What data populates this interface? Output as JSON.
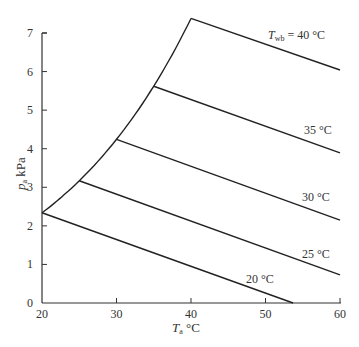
{
  "chart_data": {
    "type": "line",
    "title": "",
    "xlabel": "T_a °C",
    "ylabel": "p_a kPa",
    "xlim": [
      20,
      60
    ],
    "ylim": [
      0,
      7
    ],
    "x_ticks": [
      20,
      30,
      40,
      50,
      60
    ],
    "y_ticks": [
      0,
      1,
      2,
      3,
      4,
      5,
      6,
      7
    ],
    "grid": false,
    "legend": null,
    "saturation_curve": {
      "name": "saturation",
      "x": [
        20,
        25,
        30,
        35,
        40
      ],
      "y": [
        2.34,
        3.17,
        4.24,
        5.62,
        7.38
      ]
    },
    "series": [
      {
        "name": "T_wb = 20 °C",
        "label": "20 °C",
        "x": [
          20,
          53.7
        ],
        "y": [
          2.34,
          0.0
        ]
      },
      {
        "name": "T_wb = 25 °C",
        "label": "25 °C",
        "x": [
          25,
          60
        ],
        "y": [
          3.17,
          0.73
        ]
      },
      {
        "name": "T_wb = 30 °C",
        "label": "30 °C",
        "x": [
          30,
          60
        ],
        "y": [
          4.24,
          2.15
        ]
      },
      {
        "name": "T_wb = 35 °C",
        "label": "35 °C",
        "x": [
          35,
          60
        ],
        "y": [
          5.62,
          3.89
        ]
      },
      {
        "name": "T_wb = 40 °C",
        "label": "T_wb = 40 °C",
        "x": [
          40,
          60
        ],
        "y": [
          7.38,
          6.04
        ]
      }
    ],
    "annotations": [
      "T_wb = 40 °C",
      "35 °C",
      "30 °C",
      "25 °C",
      "20 °C"
    ]
  },
  "labels": {
    "x_axis_main": "T",
    "x_axis_sub": "a",
    "x_axis_unit": " °C",
    "y_axis_main": "p",
    "y_axis_sub": "a",
    "y_axis_unit": " kPa",
    "twb_main": "T",
    "twb_sub": "wb",
    "twb_rest": " = 40 °C",
    "l35": "35 °C",
    "l30": "30 °C",
    "l25": "25 °C",
    "l20": "20 °C"
  },
  "x_tick_labels": [
    "20",
    "30",
    "40",
    "50",
    "60"
  ],
  "y_tick_labels": [
    "0",
    "1",
    "2",
    "3",
    "4",
    "5",
    "6",
    "7"
  ]
}
